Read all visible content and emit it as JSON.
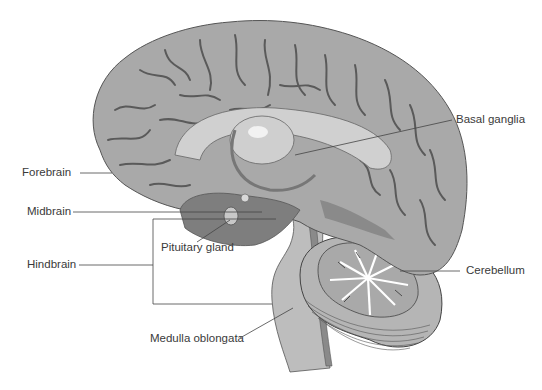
{
  "diagram": {
    "colors": {
      "cortex": "#a9a9a9",
      "sulci": "#5a5a5a",
      "midbrain_region": "#7e7e7e",
      "brainstem": "#bdbdbd",
      "highlight": "#e6e6e6",
      "leader_line": "#444444",
      "label_text": "#3a3a3a"
    },
    "labels": {
      "forebrain": "Forebrain",
      "midbrain": "Midbrain",
      "hindbrain": "Hindbrain",
      "pituitary_gland": "Pituitary gland",
      "medulla_oblongata": "Medulla oblongata",
      "basal_ganglia": "Basal ganglia",
      "cerebellum": "Cerebellum"
    }
  }
}
